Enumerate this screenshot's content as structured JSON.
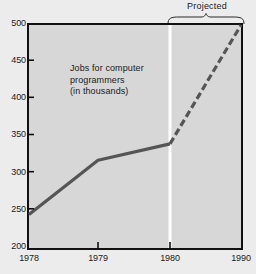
{
  "chart_data": {
    "type": "line",
    "title": "",
    "annotation_lines": [
      "Jobs for computer",
      "programmers",
      "(in thousands)"
    ],
    "xlabel": "",
    "ylabel": "",
    "ylim": [
      200,
      500
    ],
    "yticks": [
      500,
      450,
      400,
      350,
      300,
      250,
      200
    ],
    "xticks": [
      "1978",
      "1979",
      "1980",
      "1990"
    ],
    "xtick_positions": [
      1978,
      1979,
      1980,
      1990
    ],
    "grid": false,
    "legend": "none",
    "series": [
      {
        "name": "Actual",
        "style": "solid",
        "color": "#555555",
        "x": [
          1978,
          1979,
          1980
        ],
        "values": [
          245,
          318,
          340
        ]
      },
      {
        "name": "Projected",
        "style": "dashed",
        "color": "#555555",
        "x": [
          1980,
          1990
        ],
        "values": [
          340,
          500
        ]
      }
    ],
    "divider": {
      "at_x": 1980,
      "color": "#ffffff",
      "label": "Projected"
    },
    "projected_bracket": {
      "label": "Projected",
      "from_x": 1980,
      "to_x": 1990
    },
    "colors": {
      "plot_background": "#d7d7d7",
      "page_background": "#ececec",
      "frame": "#111111",
      "line": "#555555",
      "divider": "#ffffff",
      "text": "#1a1a1a"
    }
  }
}
